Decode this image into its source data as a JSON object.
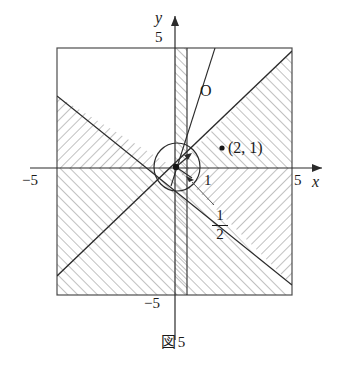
{
  "figure": {
    "caption_symbol": "図",
    "caption_number": "5",
    "axes": {
      "x_axis_label": "x",
      "y_axis_label": "y",
      "x_tick_left": "−5",
      "x_tick_right": "5",
      "y_tick_top": "5",
      "y_tick_bottom": "−5",
      "x_range": [
        -5,
        5
      ],
      "y_range": [
        -5,
        5
      ]
    },
    "annotations": [
      {
        "name": "origin-label",
        "text": "O",
        "x": 200,
        "y": 90
      },
      {
        "name": "point-label",
        "text": "(2, 1)",
        "x": 230,
        "y": 152
      },
      {
        "name": "radius-one-label",
        "text": "1",
        "x": 204,
        "y": 181
      }
    ],
    "fraction_label": {
      "numerator": "1",
      "denominator": "2"
    },
    "marked_points": [
      {
        "name": "point-2-1",
        "x": 2,
        "y": 1
      },
      {
        "name": "point-center",
        "x": 0.12,
        "y": 0.0
      }
    ],
    "circle": {
      "center_x": 0.15,
      "center_y": 0.0,
      "radius": 1.0
    },
    "lines": [
      {
        "name": "line-y-equals-x",
        "slope": 1,
        "intercept": 0
      },
      {
        "name": "line-y-equals-minus-x",
        "slope": -1,
        "intercept": 0
      },
      {
        "name": "line-steep",
        "slope": 2.6,
        "intercept": -0.35
      },
      {
        "name": "line-vertical-half",
        "type": "vertical",
        "x": 0.5
      }
    ],
    "hatched_regions": [
      "upper-left-triangle",
      "lower-left-triangle",
      "upper-right-region",
      "lower-right-region",
      "vertical-band-near-y-axis"
    ],
    "colors": {
      "ink": "#1a1a1a",
      "hatch": "#8d8d8d",
      "frame": "#4d4d4d"
    }
  }
}
